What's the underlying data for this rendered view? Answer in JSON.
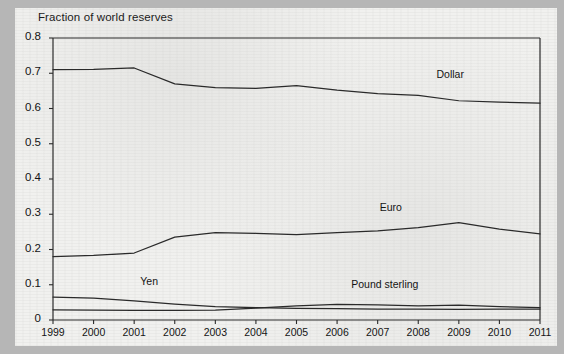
{
  "chart_data": {
    "type": "line",
    "title": "Fraction of world reserves",
    "xlabel": "",
    "ylabel": "",
    "x": [
      1999,
      2000,
      2001,
      2002,
      2003,
      2004,
      2005,
      2006,
      2007,
      2008,
      2009,
      2010,
      2011
    ],
    "categories": [
      "1999",
      "2000",
      "2001",
      "2002",
      "2003",
      "2004",
      "2005",
      "2006",
      "2007",
      "2008",
      "2009",
      "2010",
      "2011"
    ],
    "xlim": [
      1999,
      2011
    ],
    "ylim": [
      0,
      0.8
    ],
    "yticks": [
      0,
      0.1,
      0.2,
      0.3,
      0.4,
      0.5,
      0.6,
      0.7,
      0.8
    ],
    "ytick_labels": [
      "0",
      "0.1",
      "0.2",
      "0.3",
      "0.4",
      "0.5",
      "0.6",
      "0.7",
      "0.8"
    ],
    "grid": false,
    "legend_position": "inline-annotations",
    "series": [
      {
        "name": "Dollar",
        "label": "Dollar",
        "color": "#2a2a2a",
        "label_x": 2008.45,
        "label_y": 0.695,
        "values": [
          0.71,
          0.711,
          0.715,
          0.67,
          0.659,
          0.657,
          0.665,
          0.652,
          0.642,
          0.637,
          0.622,
          0.618,
          0.615
        ]
      },
      {
        "name": "Euro",
        "label": "Euro",
        "color": "#2a2a2a",
        "label_x": 2007.05,
        "label_y": 0.318,
        "values": [
          0.18,
          0.183,
          0.19,
          0.235,
          0.248,
          0.246,
          0.242,
          0.248,
          0.253,
          0.262,
          0.276,
          0.258,
          0.244
        ]
      },
      {
        "name": "Yen",
        "label": "Yen",
        "color": "#2a2a2a",
        "label_x": 2001.15,
        "label_y": 0.108,
        "values": [
          0.065,
          0.062,
          0.054,
          0.045,
          0.038,
          0.035,
          0.033,
          0.032,
          0.031,
          0.031,
          0.03,
          0.031,
          0.031
        ]
      },
      {
        "name": "Pound sterling",
        "label": "Pound sterling",
        "color": "#2a2a2a",
        "label_x": 2006.35,
        "label_y": 0.098,
        "values": [
          0.029,
          0.028,
          0.027,
          0.027,
          0.028,
          0.034,
          0.04,
          0.044,
          0.043,
          0.04,
          0.042,
          0.038,
          0.035
        ]
      }
    ]
  },
  "figure": {
    "background_color": "#f1f1ef",
    "page_border_color": "#b6b6b6",
    "axis_color": "#2a2a2a"
  }
}
